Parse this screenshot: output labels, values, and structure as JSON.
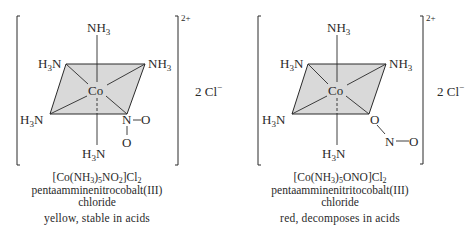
{
  "complexes": [
    {
      "ligands": {
        "top": [
          "NH",
          "3",
          ""
        ],
        "upper_left": [
          "H",
          "3",
          "N"
        ],
        "upper_right": [
          "NH",
          "3",
          ""
        ],
        "lower_left": [
          "H",
          "3",
          "N"
        ],
        "bottom": [
          "H",
          "3",
          "N"
        ]
      },
      "metal": "Co",
      "isomer_group": {
        "atom1": "N",
        "atom2": "O",
        "atom3": "O"
      },
      "charge": "2+",
      "counter_ion": {
        "prefix": "2 Cl",
        "sup": "−"
      },
      "formula": {
        "a": "[Co(NH",
        "b": "3",
        "c": ")",
        "d": "5",
        "e": "NO",
        "f": "2",
        "g": "]Cl",
        "h": "2"
      },
      "name_line1": "pentaamminenitrocobalt(III)",
      "name_line2": "chloride",
      "description": "yellow, stable in acids"
    },
    {
      "ligands": {
        "top": [
          "NH",
          "3",
          ""
        ],
        "upper_left": [
          "H",
          "3",
          "N"
        ],
        "upper_right": [
          "NH",
          "3",
          ""
        ],
        "lower_left": [
          "H",
          "3",
          "N"
        ],
        "bottom": [
          "H",
          "3",
          "N"
        ]
      },
      "metal": "Co",
      "isomer_group": {
        "atom1": "O",
        "atom2": "N",
        "atom3": "O"
      },
      "charge": "2+",
      "counter_ion": {
        "prefix": "2 Cl",
        "sup": "−"
      },
      "formula": {
        "a": "[Co(NH",
        "b": "3",
        "c": ")",
        "d": "5",
        "e": "ONO",
        "f": "",
        "g": "]Cl",
        "h": "2"
      },
      "name_line1": "pentaamminenitritocobalt(III)",
      "name_line2": "chloride",
      "description": "red, decomposes in acids"
    }
  ],
  "colors": {
    "plane_fill": "#d9d9d9",
    "ink": "#2a2a2a"
  }
}
